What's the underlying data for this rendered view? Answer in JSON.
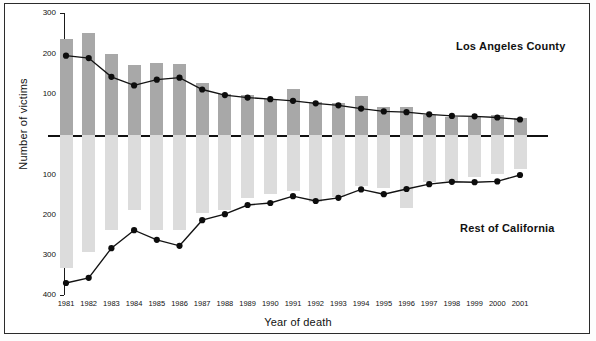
{
  "figure": {
    "frame_color": "#2b2b2b",
    "background": "#ffffff"
  },
  "axes": {
    "ylabel": "Number of victims",
    "xlabel": "Year of death",
    "y_ticks_upper": [
      "300",
      "200",
      "100"
    ],
    "y_ticks_lower": [
      "100",
      "200",
      "300",
      "400"
    ]
  },
  "legend": {
    "upper": "Los Angeles County",
    "lower": "Rest of California"
  },
  "chart_data": {
    "type": "bar",
    "title": "",
    "subtitle": "",
    "xlabel": "Year of death",
    "ylabel": "Number of victims",
    "grid": false,
    "legend_position": "inside-right",
    "axis_style": "mirrored / back-to-back (upper panel counts up from 0 to 300, lower panel counts down from 0 to 400)",
    "ylim_upper": [
      0,
      300
    ],
    "ylim_lower": [
      0,
      400
    ],
    "categories": [
      "1981",
      "1982",
      "1983",
      "1984",
      "1985",
      "1986",
      "1987",
      "1988",
      "1989",
      "1990",
      "1991",
      "1992",
      "1993",
      "1994",
      "1995",
      "1996",
      "1997",
      "1998",
      "1999",
      "2000",
      "2001"
    ],
    "series": [
      {
        "name": "Los Angeles County",
        "panel": "upper",
        "render": "bar",
        "color": "#a8a8a8",
        "values": [
          237,
          252,
          198,
          172,
          176,
          174,
          129,
          102,
          98,
          88,
          114,
          80,
          79,
          95,
          68,
          70,
          50,
          44,
          45,
          49,
          42
        ]
      },
      {
        "name": "Los Angeles County",
        "panel": "upper",
        "render": "line",
        "color": "#131313",
        "values": [
          195,
          189,
          143,
          122,
          136,
          141,
          112,
          98,
          92,
          88,
          84,
          78,
          73,
          65,
          58,
          56,
          51,
          47,
          46,
          43,
          38
        ]
      },
      {
        "name": "Rest of California",
        "panel": "lower",
        "render": "bar",
        "color": "#dcdcdc",
        "values": [
          333,
          293,
          237,
          188,
          237,
          238,
          196,
          187,
          158,
          148,
          140,
          168,
          154,
          128,
          132,
          183,
          117,
          114,
          105,
          98,
          85
        ]
      },
      {
        "name": "Rest of California",
        "panel": "lower",
        "render": "line",
        "color": "#131313",
        "values": [
          370,
          357,
          283,
          238,
          262,
          277,
          213,
          198,
          175,
          170,
          153,
          165,
          157,
          136,
          148,
          135,
          123,
          117,
          118,
          116,
          100
        ]
      }
    ]
  }
}
